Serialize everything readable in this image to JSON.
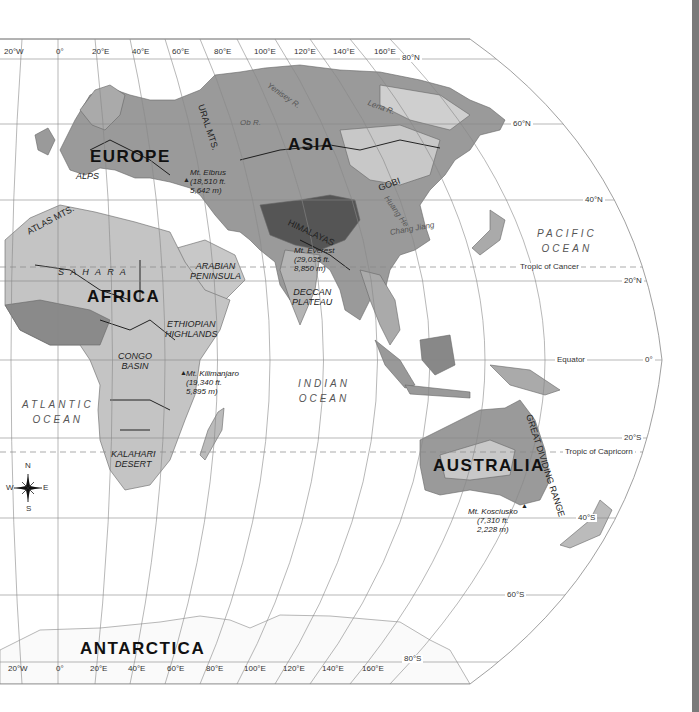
{
  "map": {
    "colors": {
      "ocean": "#ffffff",
      "land_low": "#8f8f8f",
      "land_mid": "#c4c4c4",
      "land_high": "#5a5a5a",
      "border": "#111111",
      "graticule": "#888888",
      "sidebar": "#7a7a7a"
    },
    "continents": [
      {
        "id": "europe",
        "label": "EUROPE"
      },
      {
        "id": "asia",
        "label": "ASIA"
      },
      {
        "id": "africa",
        "label": "AFRICA"
      },
      {
        "id": "australia",
        "label": "AUSTRALIA"
      },
      {
        "id": "antarctica",
        "label": "ANTARCTICA"
      }
    ],
    "oceans": [
      {
        "id": "pacific",
        "line1": "PACIFIC",
        "line2": "OCEAN"
      },
      {
        "id": "atlantic",
        "line1": "ATLANTIC",
        "line2": "OCEAN"
      },
      {
        "id": "indian",
        "line1": "INDIAN",
        "line2": "OCEAN"
      }
    ],
    "regions": [
      {
        "id": "alps",
        "label": "ALPS"
      },
      {
        "id": "atlas",
        "label": "ATLAS MTS."
      },
      {
        "id": "sahara",
        "label": "S A H A R A"
      },
      {
        "id": "ural",
        "label": "URAL MTS."
      },
      {
        "id": "himalayas",
        "label": "HIMALAYAS"
      },
      {
        "id": "gobi",
        "label": "GOBI"
      },
      {
        "id": "arabian",
        "line1": "ARABIAN",
        "line2": "PENINSULA"
      },
      {
        "id": "deccan",
        "line1": "DECCAN",
        "line2": "PLATEAU"
      },
      {
        "id": "ethiopian",
        "line1": "ETHIOPIAN",
        "line2": "HIGHLANDS"
      },
      {
        "id": "congo",
        "line1": "CONGO",
        "line2": "BASIN"
      },
      {
        "id": "kalahari",
        "line1": "KALAHARI",
        "line2": "DESERT"
      },
      {
        "id": "great_dividing",
        "label": "GREAT DIVIDING RANGE"
      }
    ],
    "rivers": [
      {
        "id": "ob",
        "label": "Ob R."
      },
      {
        "id": "yenisey",
        "label": "Yenisey R."
      },
      {
        "id": "lena",
        "label": "Lena R."
      },
      {
        "id": "huang",
        "label": "Huang He"
      },
      {
        "id": "chang",
        "label": "Chang Jiang"
      },
      {
        "id": "congo_r",
        "label": "Congo R."
      },
      {
        "id": "volga",
        "label": "Volga R."
      }
    ],
    "peaks": [
      {
        "id": "elbrus",
        "name": "Mt. Elbrus",
        "ft": "(18,510 ft.",
        "m": "5,642 m)"
      },
      {
        "id": "everest",
        "name": "Mt. Everest",
        "ft": "(29,035 ft.",
        "m": "8,850 m)"
      },
      {
        "id": "kilimanjaro",
        "name": "Mt. Kilimanjaro",
        "ft": "(19,340 ft.",
        "m": "5,895 m)"
      },
      {
        "id": "kosciusko",
        "name": "Mt. Kosciusko",
        "ft": "(7,310 ft.",
        "m": "2,228 m)"
      }
    ],
    "special_lines": {
      "tropic_cancer": "Tropic of Cancer",
      "equator": "Equator",
      "tropic_capricorn": "Tropic of Capricorn"
    },
    "latitude_labels": [
      "80°N",
      "60°N",
      "40°N",
      "20°N",
      "0°",
      "20°S",
      "40°S",
      "60°S",
      "80°S"
    ],
    "longitude_labels_top": [
      "20°W",
      "0°",
      "20°E",
      "40°E",
      "60°E",
      "80°E",
      "100°E",
      "120°E",
      "140°E",
      "160°E"
    ],
    "longitude_labels_bottom": [
      "20°W",
      "0°",
      "20°E",
      "40°E",
      "60°E",
      "80°E",
      "100°E",
      "120°E",
      "140°E",
      "160°E"
    ],
    "compass": {
      "n": "N",
      "s": "S",
      "e": "E",
      "w": "W"
    }
  }
}
